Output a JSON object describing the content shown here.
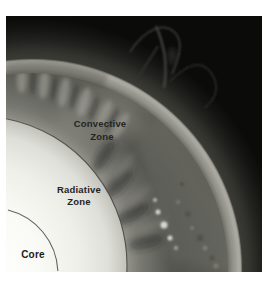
{
  "figure": {
    "labels": {
      "convective": {
        "line1": "Convective",
        "line2": "Zone"
      },
      "radiative": {
        "line1": "Radiative",
        "line2": "Zone"
      },
      "core": {
        "line1": "Core"
      }
    },
    "colors": {
      "page_background": "#ffffff",
      "corona_black": "#0b0b0a",
      "photosphere_gray": "#a3a39b",
      "radiative_white": "#ffffff",
      "boundary_line": "#3c3c38",
      "label_text": "#24241f"
    }
  }
}
